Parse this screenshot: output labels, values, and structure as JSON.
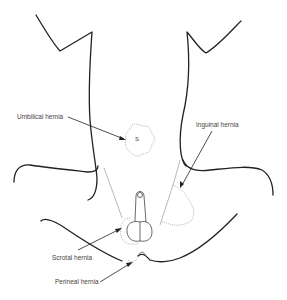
{
  "diagram": {
    "labels": {
      "umbilical": "Umbilical hernia",
      "inguinal": "Inguinal hernia",
      "scrotal": "Scrotal hernia",
      "perineal": "Perineal hernia",
      "umbilicus_marker": "S"
    }
  }
}
